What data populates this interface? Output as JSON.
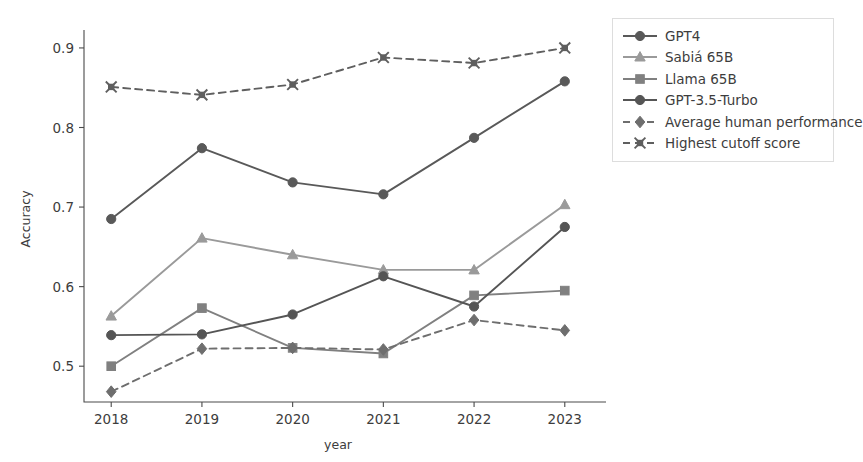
{
  "chart_data": {
    "type": "line",
    "title": "",
    "xlabel": "year",
    "ylabel": "Accuracy",
    "x": [
      2018,
      2019,
      2020,
      2021,
      2022,
      2023
    ],
    "xtick_labels": [
      "2018",
      "2019",
      "2020",
      "2021",
      "2022",
      "2023"
    ],
    "ytick_labels": [
      "0.5",
      "0.6",
      "0.7",
      "0.8",
      "0.9"
    ],
    "yticks": [
      0.5,
      0.6,
      0.7,
      0.8,
      0.9
    ],
    "xlim": [
      2017.7,
      2023.3
    ],
    "ylim": [
      0.455,
      0.915
    ],
    "grid": false,
    "legend_position": "right-outside",
    "series": [
      {
        "name": "GPT4",
        "values": [
          0.685,
          0.774,
          0.731,
          0.716,
          0.787,
          0.858
        ],
        "color": "#595959",
        "marker": "circle",
        "linestyle": "solid"
      },
      {
        "name": "Sabiá 65B",
        "values": [
          0.563,
          0.661,
          0.64,
          0.621,
          0.621,
          0.703
        ],
        "color": "#9a9a9a",
        "marker": "triangle",
        "linestyle": "solid"
      },
      {
        "name": "Llama 65B",
        "values": [
          0.5,
          0.573,
          0.523,
          0.516,
          0.589,
          0.595
        ],
        "color": "#808080",
        "marker": "square",
        "linestyle": "solid"
      },
      {
        "name": "GPT-3.5-Turbo",
        "values": [
          0.539,
          0.54,
          0.565,
          0.613,
          0.575,
          0.675
        ],
        "color": "#555555",
        "marker": "circle",
        "linestyle": "solid"
      },
      {
        "name": "Average human performance",
        "values": [
          0.468,
          0.522,
          0.523,
          0.521,
          0.558,
          0.545
        ],
        "color": "#6e6e6e",
        "marker": "diamond",
        "linestyle": "dashed"
      },
      {
        "name": "Highest cutoff score",
        "values": [
          0.851,
          0.841,
          0.854,
          0.888,
          0.881,
          0.9
        ],
        "color": "#5f5f5f",
        "marker": "x-square",
        "linestyle": "dashed"
      }
    ]
  },
  "axes": {
    "x_axis_label": "year",
    "y_axis_label": "Accuracy"
  },
  "legend": {
    "entries": [
      {
        "label": "GPT4"
      },
      {
        "label": "Sabiá 65B"
      },
      {
        "label": "Llama 65B"
      },
      {
        "label": "GPT-3.5-Turbo"
      },
      {
        "label": "Average human performance"
      },
      {
        "label": "Highest cutoff score"
      }
    ]
  },
  "colors": {
    "background": "#ffffff",
    "axis": "#4a4a4a",
    "text": "#3d3d3d",
    "legend_border": "#dddddd"
  }
}
